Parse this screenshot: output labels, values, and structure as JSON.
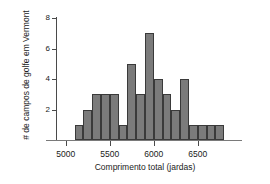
{
  "chart_data": {
    "type": "bar",
    "title": "",
    "subtitle": "",
    "xlabel": "Comprimento total (jardas)",
    "ylabel": "# de campos de golfe em Vermont",
    "bin_width": 100,
    "bin_starts": [
      5100,
      5200,
      5300,
      5400,
      5500,
      5600,
      5700,
      5800,
      5900,
      6000,
      6100,
      6200,
      6300,
      6400,
      6500,
      6600,
      6700
    ],
    "categories": [
      "5100-5200",
      "5200-5300",
      "5300-5400",
      "5400-5500",
      "5500-5600",
      "5600-5700",
      "5700-5800",
      "5800-5900",
      "5900-6000",
      "6000-6100",
      "6100-6200",
      "6200-6300",
      "6300-6400",
      "6400-6500",
      "6500-6600",
      "6600-6700",
      "6700-6800"
    ],
    "values": [
      1,
      2,
      3,
      3,
      3,
      1,
      5,
      3,
      7,
      4,
      3,
      2,
      4,
      1,
      1,
      1,
      1
    ],
    "xlim": [
      4900,
      6900
    ],
    "ylim": [
      0,
      8
    ],
    "x_ticks": [
      5000,
      5500,
      6000,
      6500
    ],
    "x_tick_labels": [
      "5000",
      "5500",
      "6000",
      "6500"
    ],
    "y_ticks": [
      0,
      2,
      4,
      6,
      8
    ],
    "y_tick_labels": [
      "",
      "2",
      "4",
      "6",
      "8"
    ],
    "grid": false,
    "legend": null,
    "bar_color": "#7b7b7b",
    "bar_edge_color": "#3a3a3a",
    "axis_color": "#4a4a4a"
  }
}
